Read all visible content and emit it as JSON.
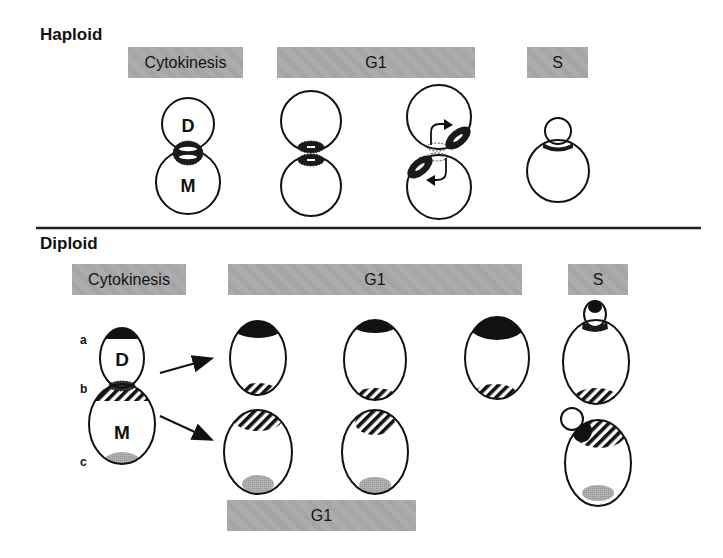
{
  "colors": {
    "bar_fill": "#a9a9a9",
    "outline": "#111111",
    "cap_dark": "#111111",
    "cap_gray": "#a8a8a8",
    "divider": "#222222"
  },
  "haploid": {
    "title": "Haploid",
    "bars": [
      {
        "label": "Cytokinesis",
        "x": 128,
        "y": 47,
        "w": 115
      },
      {
        "label": "G1",
        "x": 277,
        "y": 47,
        "w": 198
      },
      {
        "label": "S",
        "x": 527,
        "y": 47,
        "w": 61
      }
    ],
    "cells": [
      {
        "id": "cytokinesis-pair",
        "stage": "Cytokinesis",
        "daughter": {
          "cx": 188,
          "cy": 124,
          "r": 26,
          "label": "D"
        },
        "mother": {
          "cx": 188,
          "cy": 182,
          "r": 32,
          "label": "M"
        },
        "ring": "double ring at bud neck"
      },
      {
        "id": "g1-pair-1",
        "stage": "G1",
        "daughter": {
          "cx": 311,
          "cy": 121,
          "r": 30
        },
        "mother": {
          "cx": 311,
          "cy": 186,
          "r": 30
        },
        "ring": "split ring at division site"
      },
      {
        "id": "g1-pair-2",
        "stage": "G1",
        "daughter": {
          "cx": 439,
          "cy": 117,
          "r": 32
        },
        "mother": {
          "cx": 439,
          "cy": 187,
          "r": 32
        },
        "ring": "new ring adjacent to old site (arrows)"
      },
      {
        "id": "s-budded",
        "stage": "S",
        "bud": {
          "cx": 558,
          "cy": 131,
          "r": 13
        },
        "mother": {
          "cx": 558,
          "cy": 171,
          "r": 31
        },
        "ring": "ring at bud neck"
      }
    ]
  },
  "divider": {
    "x1": 36,
    "x2": 701,
    "y": 228
  },
  "diploid": {
    "title": "Diploid",
    "bars": [
      {
        "label": "Cytokinesis",
        "x": 72,
        "y": 264,
        "w": 114
      },
      {
        "label": "G1",
        "x": 228,
        "y": 264,
        "w": 294
      },
      {
        "label": "S",
        "x": 568,
        "y": 264,
        "w": 60
      },
      {
        "label": "G1",
        "x": 227,
        "y": 500,
        "w": 189
      }
    ],
    "pole_labels": [
      {
        "text": "a",
        "x": 80,
        "y": 341
      },
      {
        "text": "b",
        "x": 80,
        "y": 390
      },
      {
        "text": "c",
        "x": 80,
        "y": 463
      }
    ],
    "cytokinesis": {
      "daughter": {
        "cx": 122,
        "cy": 358,
        "rx": 22,
        "ry": 30,
        "label": "D"
      },
      "mother": {
        "cx": 122,
        "cy": 424,
        "rx": 33,
        "ry": 40,
        "label": "M"
      }
    },
    "arrows": [
      {
        "x1": 160,
        "y1": 373,
        "x2": 212,
        "y2": 358
      },
      {
        "x1": 160,
        "y1": 416,
        "x2": 212,
        "y2": 440
      }
    ],
    "daughter_row": [
      {
        "cx": 258,
        "cy": 358,
        "rx": 28,
        "ry": 37
      },
      {
        "cx": 375,
        "cy": 360,
        "rx": 31,
        "ry": 40
      },
      {
        "cx": 497,
        "cy": 358,
        "rx": 32,
        "ry": 41
      }
    ],
    "mother_row": [
      {
        "cx": 258,
        "cy": 452,
        "rx": 34,
        "ry": 42
      },
      {
        "cx": 375,
        "cy": 452,
        "rx": 33,
        "ry": 42
      }
    ],
    "s_cells": [
      {
        "id": "s-daughter",
        "bud": {
          "cx": 595,
          "cy": 314,
          "rx": 11,
          "ry": 13
        },
        "mother": {
          "cx": 596,
          "cy": 362,
          "rx": 33,
          "ry": 42
        }
      },
      {
        "id": "s-mother",
        "bud": {
          "cx": 572,
          "cy": 419,
          "rx": 11,
          "ry": 11
        },
        "mother": {
          "cx": 598,
          "cy": 463,
          "rx": 33,
          "ry": 43
        }
      }
    ]
  }
}
